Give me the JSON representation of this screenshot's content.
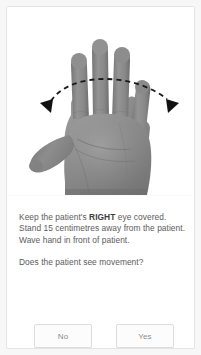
{
  "card": {
    "illustration": {
      "name": "open-right-hand-photo",
      "description": "Grayscale photograph of an open hand, palm toward viewer",
      "arrow": {
        "name": "waving-motion-arc-arrow",
        "style": "dashed double-headed arc",
        "color": "#1a1a1a"
      }
    },
    "instructions": [
      {
        "before": "Keep the patient's ",
        "strong": "RIGHT",
        "after": " eye covered."
      },
      {
        "before": "Stand 15 centimetres away from the patient.",
        "strong": "",
        "after": ""
      },
      {
        "before": "Wave hand in front of patient.",
        "strong": "",
        "after": ""
      }
    ],
    "question": "Does the patient see movement?",
    "buttons": {
      "no_label": "No",
      "yes_label": "Yes"
    }
  },
  "colors": {
    "page_background": "#f7f7f7",
    "card_background": "#ffffff",
    "card_border": "#e4e4e4",
    "text": "#5b5b5b",
    "text_strong": "#3d3d3d",
    "button_border": "#dcdcdc",
    "button_text": "#8c8c8c"
  }
}
